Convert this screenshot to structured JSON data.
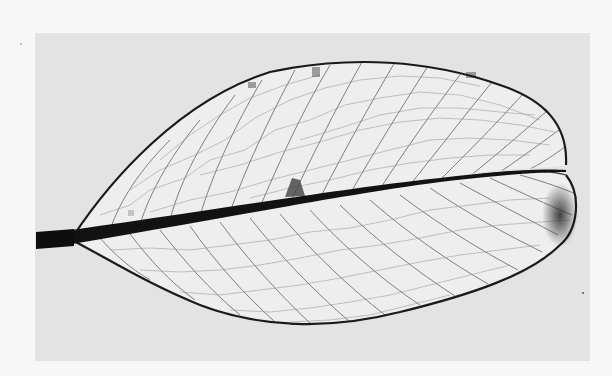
{
  "image": {
    "subject": "skeletonized leaf showing reticulate venation",
    "style": "grayscale photograph",
    "colors": {
      "page_background": "#f7f7f7",
      "photo_background": "#e3e3e3",
      "leaf_fill": "#efefef",
      "vein_dark": "#1a1a1a",
      "vein_light": "#6a6a6a",
      "margin_stain": "#3a3a3a"
    },
    "photo_bounds": {
      "x": 35,
      "y": 33,
      "width": 555,
      "height": 328
    }
  }
}
